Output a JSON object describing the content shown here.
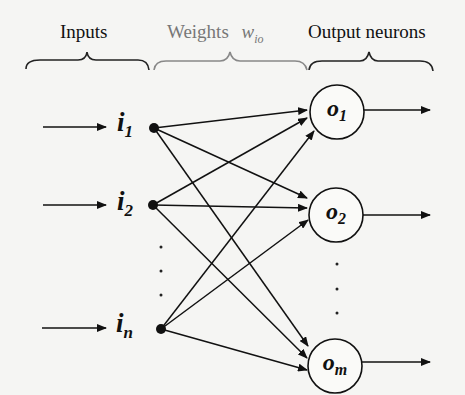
{
  "header": {
    "inputs_label": "Inputs",
    "weights_label": "Weights",
    "weights_symbol": "w",
    "weights_subscript": "io",
    "outputs_label": "Output neurons"
  },
  "inputs": [
    {
      "symbol": "i",
      "subscript": "1"
    },
    {
      "symbol": "i",
      "subscript": "2"
    },
    {
      "symbol": "i",
      "subscript": "n"
    }
  ],
  "outputs": [
    {
      "symbol": "o",
      "subscript": "1"
    },
    {
      "symbol": "o",
      "subscript": "2"
    },
    {
      "symbol": "o",
      "subscript": "m"
    }
  ],
  "ellipsis": "⋮",
  "colors": {
    "line": "#111111",
    "weights_label": "#777777",
    "background": "#f5f5f3"
  }
}
